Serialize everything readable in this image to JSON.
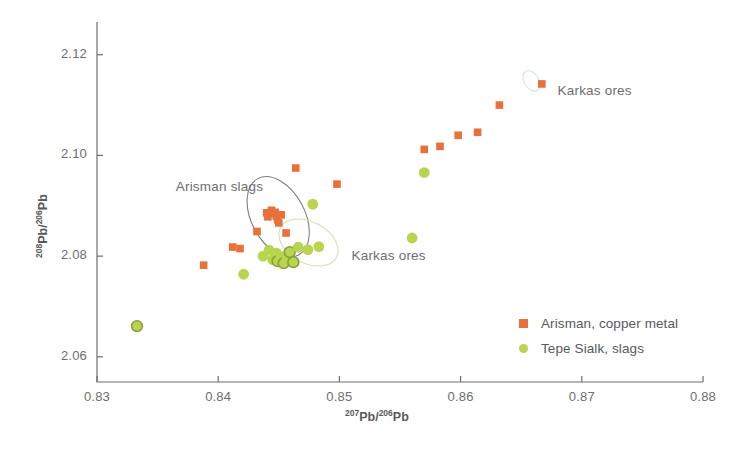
{
  "chart_data": {
    "type": "scatter",
    "title": "",
    "xlabel": "207Pb/206Pb",
    "ylabel": "208Pb/206Pb",
    "xlabel_parts": {
      "sup1": "207",
      "mid": "Pb/",
      "sup2": "206",
      "end": "Pb"
    },
    "ylabel_parts": {
      "sup1": "208",
      "mid": "Pb/",
      "sup2": "206",
      "end": "Pb"
    },
    "xlim": [
      0.83,
      0.88
    ],
    "ylim": [
      2.055,
      2.1265
    ],
    "xticks": [
      0.83,
      0.84,
      0.85,
      0.86,
      0.87,
      0.88
    ],
    "xtick_labels": [
      "0.83",
      "0.84",
      "0.85",
      "0.86",
      "0.87",
      "0.88"
    ],
    "yticks": [
      2.06,
      2.08,
      2.1,
      2.12
    ],
    "ytick_labels": [
      "2.06",
      "2.08",
      "2.10",
      "2.12"
    ],
    "grid": false,
    "legend_position": "bottom-right",
    "colors": {
      "arisman_copper": "#e8703a",
      "tepe_sialk": "#b9d44e",
      "tepe_sialk_outline": "#8aa13a",
      "ellipse_grey": "#7b7f87",
      "ellipse_green": "#d4e3b4",
      "axis": "#6d6e70",
      "text": "#58595b"
    },
    "series": [
      {
        "name": "Arisman, copper metal",
        "marker": "square",
        "color": "#e8703a",
        "points": [
          [
            0.8388,
            2.0782
          ],
          [
            0.8412,
            2.0818
          ],
          [
            0.8418,
            2.0815
          ],
          [
            0.8432,
            2.0849
          ],
          [
            0.844,
            2.0886
          ],
          [
            0.8441,
            2.0878
          ],
          [
            0.8444,
            2.0891
          ],
          [
            0.8445,
            2.0884
          ],
          [
            0.8447,
            2.0887
          ],
          [
            0.8448,
            2.0879
          ],
          [
            0.8449,
            2.0872
          ],
          [
            0.845,
            2.0866
          ],
          [
            0.8452,
            2.0882
          ],
          [
            0.8456,
            2.0846
          ],
          [
            0.8464,
            2.0975
          ],
          [
            0.8498,
            2.0943
          ],
          [
            0.857,
            2.1012
          ],
          [
            0.8583,
            2.1018
          ],
          [
            0.8598,
            2.104
          ],
          [
            0.8614,
            2.1046
          ],
          [
            0.8632,
            2.11
          ],
          [
            0.8667,
            2.1142
          ]
        ]
      },
      {
        "name": "Tepe Sialk, slags",
        "marker": "circle",
        "color": "#b9d44e",
        "points": [
          [
            0.8333,
            2.0661
          ],
          [
            0.8421,
            2.0764
          ],
          [
            0.8437,
            2.08
          ],
          [
            0.8442,
            2.0812
          ],
          [
            0.8445,
            2.0793
          ],
          [
            0.8448,
            2.0806
          ],
          [
            0.8449,
            2.079
          ],
          [
            0.8452,
            2.0799
          ],
          [
            0.8454,
            2.0786
          ],
          [
            0.8457,
            2.0795
          ],
          [
            0.8459,
            2.0808
          ],
          [
            0.8462,
            2.0788
          ],
          [
            0.8466,
            2.0818
          ],
          [
            0.8474,
            2.0813
          ],
          [
            0.8478,
            2.0903
          ],
          [
            0.8483,
            2.0819
          ],
          [
            0.856,
            2.0836
          ],
          [
            0.857,
            2.0966
          ]
        ],
        "outlined_points": [
          [
            0.8333,
            2.0661
          ],
          [
            0.8449,
            2.079
          ],
          [
            0.8454,
            2.0786
          ],
          [
            0.8459,
            2.0808
          ],
          [
            0.8462,
            2.0788
          ]
        ]
      }
    ],
    "annotations": [
      {
        "text": "Arisman slags",
        "x": 0.8365,
        "y": 2.0935
      },
      {
        "text": "Karkas ores",
        "x": 0.851,
        "y": 2.0798
      },
      {
        "text": "Karkas ores",
        "x": 0.868,
        "y": 2.1125
      }
    ],
    "ellipses": [
      {
        "name": "arisman-slags-ellipse",
        "cx": 0.84495,
        "cy": 2.0878,
        "rx": 0.0022,
        "ry": 0.0086,
        "rotation": -28,
        "stroke": "#7b7f87"
      },
      {
        "name": "karkas-ores-ellipse-main",
        "cx": 0.84745,
        "cy": 2.0827,
        "rx": 0.0017,
        "ry": 0.0063,
        "rotation": -62,
        "stroke": "#d4e3b4"
      },
      {
        "name": "karkas-ores-ellipse-small",
        "cx": 0.86585,
        "cy": 2.1148,
        "rx": 0.0006,
        "ry": 0.0022,
        "rotation": -32,
        "stroke": "#d6e2ea"
      }
    ]
  }
}
